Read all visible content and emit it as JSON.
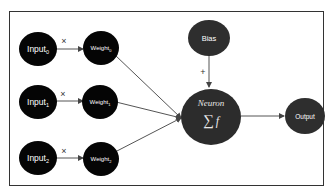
{
  "diagram": {
    "colors": {
      "input_fill": "#050505",
      "weight_fill": "#050505",
      "neuron_fill": "#2c2c2c",
      "bias_fill": "#2e2e2e",
      "output_fill": "#2e2e2e",
      "edge": "#555555",
      "text": "#ffffff",
      "frame": "#333333"
    },
    "inputs": [
      {
        "base": "Input",
        "sub": "0"
      },
      {
        "base": "Input",
        "sub": "1"
      },
      {
        "base": "Input",
        "sub": "2"
      }
    ],
    "weights": [
      {
        "base": "Weight",
        "sub": "0"
      },
      {
        "base": "Weight",
        "sub": "1"
      },
      {
        "base": "Weight",
        "sub": "2"
      }
    ],
    "multiply_symbol": "×",
    "bias": {
      "label": "Bias",
      "operator": "+"
    },
    "neuron": {
      "title": "Neuron",
      "sum_symbol": "∑",
      "function": "f"
    },
    "output": {
      "label": "Output"
    },
    "edges": [
      {
        "from": "input-0",
        "to": "weight-0",
        "label": "×"
      },
      {
        "from": "input-1",
        "to": "weight-1",
        "label": "×"
      },
      {
        "from": "input-2",
        "to": "weight-2",
        "label": "×"
      },
      {
        "from": "weight-0",
        "to": "neuron"
      },
      {
        "from": "weight-1",
        "to": "neuron"
      },
      {
        "from": "weight-2",
        "to": "neuron"
      },
      {
        "from": "bias",
        "to": "neuron",
        "label": "+"
      },
      {
        "from": "neuron",
        "to": "output"
      }
    ]
  }
}
